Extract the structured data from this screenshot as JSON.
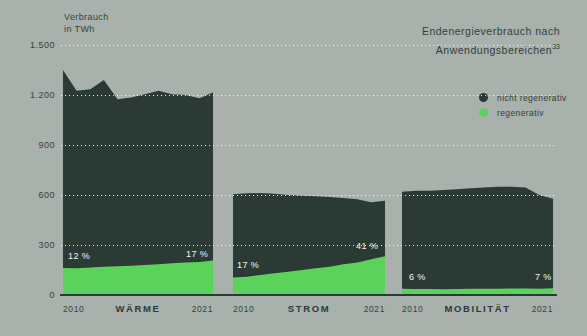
{
  "header": {
    "axis_label_line1": "Verbrauch",
    "axis_label_line2": "in TWh",
    "title_line1": "Endenergieverbrauch nach",
    "title_line2": "Anwendungsbereichen",
    "title_superscript": "33"
  },
  "legend": {
    "items": [
      {
        "label": "nicht regenerativ",
        "color": "#2c3a35"
      },
      {
        "label": "regenerativ",
        "color": "#5bd35b"
      }
    ]
  },
  "colors": {
    "background": "#a8b1ab",
    "dark_series": "#2c3a35",
    "green_series": "#5bd35b",
    "text": "#343e39",
    "white_label": "#f2f5f2"
  },
  "y_axis": {
    "unit": "TWh",
    "ticks": [
      "1.500",
      "1.200",
      "900",
      "600",
      "300",
      "0"
    ],
    "min": 0,
    "max": 1500,
    "gridlines": "dotted-white"
  },
  "chart_data": [
    {
      "type": "area",
      "title": "WÄRME",
      "x": [
        2010,
        2011,
        2012,
        2013,
        2014,
        2015,
        2016,
        2017,
        2018,
        2019,
        2020,
        2021
      ],
      "x_tick_labels": [
        "2010",
        "2021"
      ],
      "unit": "TWh",
      "ylim": [
        0,
        1500
      ],
      "stacked": true,
      "series": [
        {
          "name": "nicht regenerativ",
          "color": "#2c3a35",
          "values": [
            1188,
            1065,
            1070,
            1120,
            1003,
            1010,
            1025,
            1040,
            1015,
            1005,
            982,
            1008
          ]
        },
        {
          "name": "regenerativ",
          "color": "#5bd35b",
          "values": [
            162,
            160,
            165,
            170,
            172,
            175,
            180,
            185,
            190,
            195,
            198,
            207
          ]
        }
      ],
      "annotations": [
        {
          "text": "12 %",
          "position": "start",
          "meaning": "regenerativ share 2010"
        },
        {
          "text": "17 %",
          "position": "end",
          "meaning": "regenerativ share 2021"
        }
      ]
    },
    {
      "type": "area",
      "title": "STROM",
      "x": [
        2010,
        2011,
        2012,
        2013,
        2014,
        2015,
        2016,
        2017,
        2018,
        2019,
        2020,
        2021
      ],
      "x_tick_labels": [
        "2010",
        "2021"
      ],
      "unit": "TWh",
      "ylim": [
        0,
        1500
      ],
      "stacked": true,
      "series": [
        {
          "name": "nicht regenerativ",
          "color": "#2c3a35",
          "values": [
            500,
            500,
            492,
            478,
            460,
            445,
            432,
            418,
            397,
            380,
            341,
            333
          ]
        },
        {
          "name": "regenerativ",
          "color": "#5bd35b",
          "values": [
            105,
            110,
            120,
            130,
            140,
            150,
            160,
            170,
            185,
            195,
            215,
            232
          ]
        }
      ],
      "annotations": [
        {
          "text": "17 %",
          "position": "start",
          "meaning": "regenerativ share 2010"
        },
        {
          "text": "41 %",
          "position": "end",
          "meaning": "regenerativ share 2021"
        }
      ]
    },
    {
      "type": "area",
      "title": "MOBILITÄT",
      "x": [
        2010,
        2011,
        2012,
        2013,
        2014,
        2015,
        2016,
        2017,
        2018,
        2019,
        2020,
        2021
      ],
      "x_tick_labels": [
        "2010",
        "2021"
      ],
      "unit": "TWh",
      "ylim": [
        0,
        1500
      ],
      "stacked": true,
      "series": [
        {
          "name": "nicht regenerativ",
          "color": "#2c3a35",
          "values": [
            583,
            589,
            589,
            595,
            599,
            603,
            607,
            612,
            611,
            606,
            562,
            538
          ]
        },
        {
          "name": "regenerativ",
          "color": "#5bd35b",
          "values": [
            37,
            36,
            36,
            35,
            36,
            37,
            38,
            38,
            39,
            39,
            38,
            40
          ]
        }
      ],
      "annotations": [
        {
          "text": "6 %",
          "position": "start",
          "meaning": "regenerativ share 2010"
        },
        {
          "text": "7 %",
          "position": "end",
          "meaning": "regenerativ share 2021"
        }
      ]
    }
  ]
}
